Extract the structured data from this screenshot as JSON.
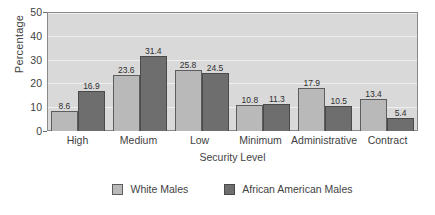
{
  "chart_data": {
    "type": "bar",
    "title": "",
    "xlabel": "Security Level",
    "ylabel": "Percentage",
    "categories": [
      "High",
      "Medium",
      "Low",
      "Minimum",
      "Administrative",
      "Contract"
    ],
    "series": [
      {
        "name": "White Males",
        "color": "#b9b9b9",
        "values": [
          8.6,
          23.6,
          25.8,
          10.8,
          17.9,
          13.4
        ]
      },
      {
        "name": "African American Males",
        "color": "#6e6e6e",
        "values": [
          16.9,
          31.4,
          24.5,
          11.3,
          10.5,
          5.4
        ]
      }
    ],
    "ylim": [
      0,
      50
    ],
    "yticks": [
      0,
      10,
      20,
      30,
      40,
      50
    ],
    "ytick_labels": [
      "0",
      "10",
      "20",
      "30",
      "40",
      "50"
    ],
    "grid": true,
    "legend_position": "bottom",
    "plot_background": "#d9d9d9",
    "data_labels": true
  }
}
